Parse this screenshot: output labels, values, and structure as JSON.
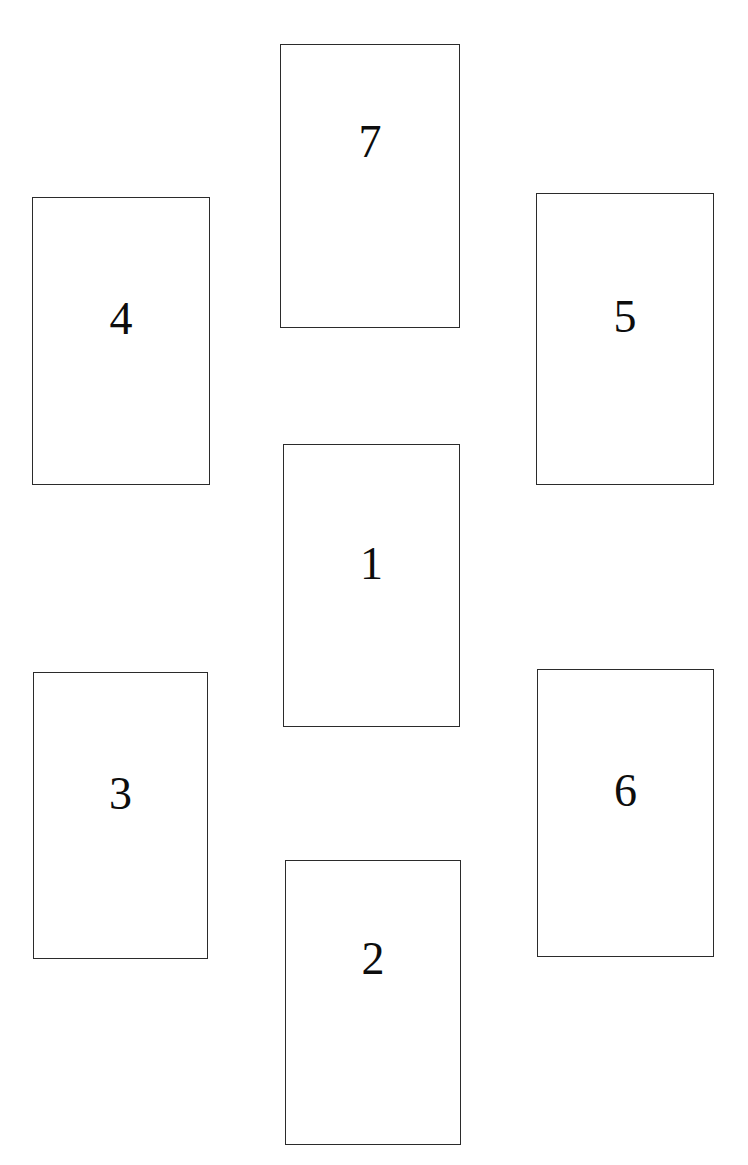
{
  "page": {
    "width": 748,
    "height": 1165,
    "background_color": "#ffffff",
    "border_color": "#2b2b2b",
    "text_color": "#0d0d0d"
  },
  "boxes": [
    {
      "label": "7",
      "name": "box-7",
      "position": "top-center",
      "x": 280,
      "y": 44,
      "width": 180,
      "height": 284,
      "label_offset": "label-up-mid"
    },
    {
      "label": "4",
      "name": "box-4",
      "position": "upper-left",
      "x": 32,
      "y": 197,
      "width": 178,
      "height": 288,
      "label_offset": "label-up-sm"
    },
    {
      "label": "5",
      "name": "box-5",
      "position": "upper-right",
      "x": 536,
      "y": 193,
      "width": 178,
      "height": 292,
      "label_offset": "label-up-sm"
    },
    {
      "label": "1",
      "name": "box-1",
      "position": "center",
      "x": 283,
      "y": 444,
      "width": 177,
      "height": 283,
      "label_offset": "label-up-sm"
    },
    {
      "label": "3",
      "name": "box-3",
      "position": "lower-left",
      "x": 33,
      "y": 672,
      "width": 175,
      "height": 287,
      "label_offset": "label-up-sm"
    },
    {
      "label": "6",
      "name": "box-6",
      "position": "lower-right",
      "x": 537,
      "y": 669,
      "width": 177,
      "height": 288,
      "label_offset": "label-up-sm"
    },
    {
      "label": "2",
      "name": "box-2",
      "position": "bottom-center",
      "x": 285,
      "y": 860,
      "width": 176,
      "height": 285,
      "label_offset": "label-up-mid"
    }
  ]
}
